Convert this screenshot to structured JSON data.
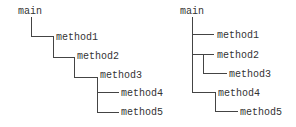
{
  "diagrams": [
    {
      "name": "nested-call-tree",
      "root": "main",
      "nodes": [
        "method1",
        "method2",
        "method3",
        "method4",
        "method5"
      ]
    },
    {
      "name": "flat-call-tree",
      "root": "main",
      "nodes": [
        "method1",
        "method2",
        "method3",
        "method4",
        "method5"
      ]
    }
  ],
  "colors": {
    "line": "#444444",
    "text": "#333333",
    "background": "#ffffff"
  }
}
